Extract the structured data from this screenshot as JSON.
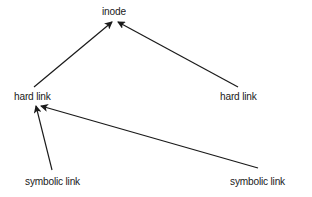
{
  "diagram": {
    "type": "directed-graph",
    "background": "#ffffff",
    "line_color": "#1a1a1a",
    "nodes": [
      {
        "id": "inode",
        "label": "inode",
        "x": 102,
        "y": 5
      },
      {
        "id": "hard_link_left",
        "label": "hard link",
        "x": 14,
        "y": 90
      },
      {
        "id": "hard_link_right",
        "label": "hard link",
        "x": 220,
        "y": 90
      },
      {
        "id": "symbolic_link_left",
        "label": "symbolic link",
        "x": 25,
        "y": 175
      },
      {
        "id": "symbolic_link_right",
        "label": "symbolic link",
        "x": 230,
        "y": 175
      }
    ],
    "edges": [
      {
        "from": "hard_link_left",
        "to": "inode",
        "x1": 34,
        "y1": 87,
        "x2": 112,
        "y2": 22
      },
      {
        "from": "hard_link_right",
        "to": "inode",
        "x1": 238,
        "y1": 87,
        "x2": 118,
        "y2": 22
      },
      {
        "from": "symbolic_link_left",
        "to": "hard_link_left",
        "x1": 52,
        "y1": 170,
        "x2": 36,
        "y2": 106
      },
      {
        "from": "symbolic_link_right",
        "to": "hard_link_left",
        "x1": 258,
        "y1": 168,
        "x2": 41,
        "y2": 106
      }
    ]
  }
}
